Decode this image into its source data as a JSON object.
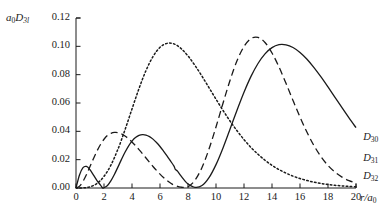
{
  "chart_data": {
    "type": "line",
    "title": "",
    "subtitle": "",
    "xlabel": "r/a0",
    "xlabel_base": "r/a",
    "xlabel_sub": "0",
    "ylabel": "a0D3l",
    "ylabel_base_a": "a",
    "ylabel_sub_a": "0",
    "ylabel_base_d": "D",
    "ylabel_sub_d": "3l",
    "xlim": [
      0,
      20
    ],
    "ylim": [
      0,
      0.12
    ],
    "grid": false,
    "legend_position": "inline-right",
    "xticks": [
      0,
      2,
      4,
      6,
      8,
      10,
      12,
      14,
      16,
      18,
      20
    ],
    "xticklabels": [
      "0",
      "2",
      "4",
      "6",
      "8",
      "10",
      "12",
      "14",
      "16",
      "18",
      "20"
    ],
    "yticks": [
      0.0,
      0.02,
      0.04,
      0.06,
      0.08,
      0.1,
      0.12
    ],
    "yticklabels": [
      "0.00",
      "0.02",
      "0.04",
      "0.06",
      "0.08",
      "0.10",
      "0.12"
    ],
    "series": [
      {
        "name": "D30",
        "name_base": "D",
        "name_sub": "30",
        "style": "solid",
        "color": "#1a1a1a",
        "label_x": 20.3,
        "label_y": 0.0345,
        "nodes": [
          1.9,
          7.1
        ],
        "peaks": [
          {
            "x": 0.77,
            "y": 0.0152
          },
          {
            "x": 4.2,
            "y": 0.0382
          },
          {
            "x": 13.1,
            "y": 0.1012
          }
        ],
        "x": [
          0,
          0.25,
          0.5,
          0.75,
          1,
          1.25,
          1.5,
          1.75,
          1.903,
          2,
          2.25,
          2.5,
          2.75,
          3,
          3.25,
          3.5,
          3.75,
          4,
          4.25,
          4.5,
          4.75,
          5,
          5.25,
          5.5,
          5.75,
          6,
          6.25,
          6.5,
          6.75,
          7,
          7.098,
          7.25,
          7.5,
          7.75,
          8,
          8.5,
          9,
          9.5,
          10,
          10.5,
          11,
          11.5,
          12,
          12.5,
          13,
          13.5,
          14,
          14.5,
          15,
          15.5,
          16,
          16.5,
          17,
          17.5,
          18,
          18.5,
          19,
          19.5,
          20
        ],
        "y": [
          0,
          0.0092,
          0.0144,
          0.0152,
          0.0129,
          0.0091,
          0.0052,
          0.0021,
          0.0,
          0.0002,
          0.0018,
          0.0052,
          0.0097,
          0.0149,
          0.0202,
          0.0252,
          0.0296,
          0.0331,
          0.0356,
          0.0371,
          0.0377,
          0.0374,
          0.0363,
          0.0345,
          0.0321,
          0.0293,
          0.0261,
          0.0227,
          0.0191,
          0.0154,
          0.0131,
          0.0119,
          0.0085,
          0.0054,
          0.0029,
          0.0005,
          0.0017,
          0.0073,
          0.0165,
          0.0283,
          0.0415,
          0.0549,
          0.0676,
          0.0788,
          0.0879,
          0.0947,
          0.0991,
          0.1012,
          0.1011,
          0.0992,
          0.0957,
          0.0909,
          0.085,
          0.0784,
          0.0713,
          0.064,
          0.0567,
          0.0495,
          0.0426
        ]
      },
      {
        "name": "D31",
        "name_base": "D",
        "name_sub": "31",
        "style": "dashed",
        "color": "#1a1a1a",
        "label_x": 20.3,
        "label_y": 0.0195,
        "nodes": [
          6.0
        ],
        "peaks": [
          {
            "x": 3.05,
            "y": 0.0391
          },
          {
            "x": 11.95,
            "y": 0.1012
          }
        ],
        "x": [
          0,
          0.25,
          0.5,
          0.75,
          1,
          1.25,
          1.5,
          1.75,
          2,
          2.25,
          2.5,
          2.75,
          3,
          3.25,
          3.5,
          3.75,
          4,
          4.25,
          4.5,
          4.75,
          5,
          5.25,
          5.5,
          5.75,
          6,
          6.25,
          6.5,
          6.75,
          7,
          7.5,
          8,
          8.5,
          9,
          9.5,
          10,
          10.5,
          11,
          11.5,
          12,
          12.5,
          13,
          13.5,
          14,
          14.5,
          15,
          15.5,
          16,
          16.5,
          17,
          17.5,
          18,
          18.5,
          19,
          19.5,
          20
        ],
        "y": [
          0,
          0.0013,
          0.0047,
          0.0095,
          0.0151,
          0.0208,
          0.0261,
          0.0307,
          0.0344,
          0.0371,
          0.0386,
          0.0392,
          0.0391,
          0.0382,
          0.0367,
          0.0348,
          0.0325,
          0.0299,
          0.0271,
          0.0242,
          0.0212,
          0.0182,
          0.0152,
          0.0124,
          0.0098,
          0.0074,
          0.0053,
          0.0035,
          0.0021,
          0.0006,
          0.0009,
          0.0055,
          0.0145,
          0.0275,
          0.0431,
          0.0598,
          0.0759,
          0.0898,
          0.0999,
          0.1055,
          0.1063,
          0.1027,
          0.0953,
          0.0854,
          0.0739,
          0.0618,
          0.0501,
          0.0393,
          0.0299,
          0.0221,
          0.0159,
          0.0112,
          0.0077,
          0.0052,
          0.0034
        ]
      },
      {
        "name": "D32",
        "name_base": "D",
        "name_sub": "32",
        "style": "dotted",
        "color": "#1a1a1a",
        "label_x": 20.3,
        "label_y": 0.0068,
        "nodes": [],
        "peaks": [
          {
            "x": 9.0,
            "y": 0.1023
          }
        ],
        "x": [
          0,
          0.5,
          1,
          1.5,
          2,
          2.5,
          3,
          3.5,
          4,
          4.5,
          5,
          5.5,
          6,
          6.5,
          7,
          7.5,
          8,
          8.5,
          9,
          9.5,
          10,
          10.5,
          11,
          11.5,
          12,
          12.5,
          13,
          13.5,
          14,
          14.5,
          15,
          15.5,
          16,
          16.5,
          17,
          17.5,
          18,
          18.5,
          19,
          19.5,
          20
        ],
        "y": [
          0,
          0.0001,
          0.0008,
          0.0032,
          0.0082,
          0.0163,
          0.0275,
          0.0411,
          0.0558,
          0.0702,
          0.0829,
          0.0928,
          0.0993,
          0.1021,
          0.1017,
          0.0985,
          0.0932,
          0.0865,
          0.0789,
          0.0708,
          0.0627,
          0.0548,
          0.0473,
          0.0404,
          0.0342,
          0.0286,
          0.0238,
          0.0196,
          0.016,
          0.013,
          0.0105,
          0.0084,
          0.0067,
          0.0053,
          0.0041,
          0.0032,
          0.0025,
          0.0019,
          0.0015,
          0.0011,
          0.0009
        ]
      }
    ],
    "axes_geometry": {
      "left_px": 76,
      "right_px": 356,
      "top_px": 18,
      "bottom_px": 188
    }
  }
}
